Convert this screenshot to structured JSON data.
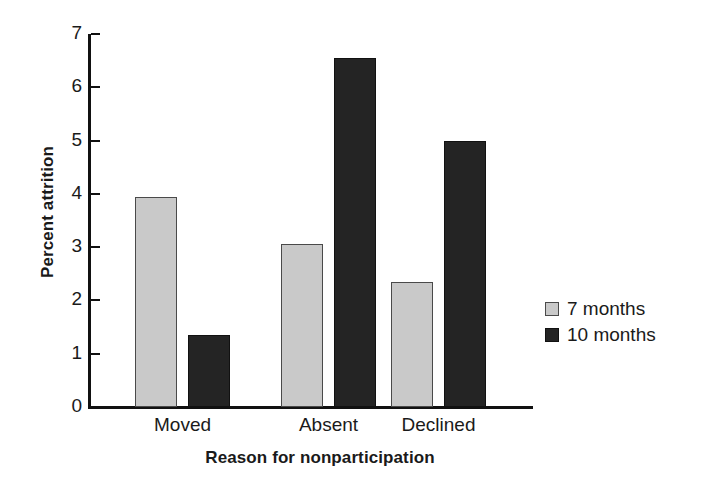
{
  "chart_data": {
    "type": "bar",
    "title": "",
    "subtitle": "",
    "xlabel": "Reason for nonparticipation",
    "ylabel": "Percent attrition",
    "categories": [
      "Moved",
      "Absent",
      "Declined"
    ],
    "series": [
      {
        "name": "7 months",
        "color": "#c9c9c9",
        "values": [
          3.95,
          3.05,
          2.35
        ]
      },
      {
        "name": "10 months",
        "color": "#242424",
        "values": [
          1.35,
          6.55,
          5.0
        ]
      }
    ],
    "ylim": [
      0,
      7
    ],
    "ytick_labels": [
      "0",
      "1",
      "2",
      "3",
      "4",
      "5",
      "6",
      "7"
    ],
    "ytick_values": [
      0,
      1,
      2,
      3,
      4,
      5,
      6,
      7
    ],
    "grid": false,
    "legend_position": "right",
    "legend_entries": [
      "7 months",
      "10 months"
    ],
    "annotations": []
  },
  "axis": {
    "y_label": "Percent attrition",
    "x_label": "Reason for nonparticipation"
  },
  "legend": {
    "items": [
      {
        "label": "7 months",
        "swatch": "light-gray-swatch"
      },
      {
        "label": "10 months",
        "swatch": "black-swatch"
      }
    ]
  },
  "colors": {
    "series_7_months": "#c9c9c9",
    "series_10_months": "#242424",
    "axis": "#111111",
    "background": "#ffffff"
  }
}
